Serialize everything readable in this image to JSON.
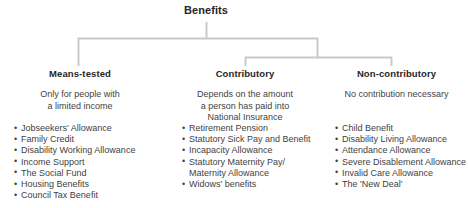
{
  "diagram": {
    "root": {
      "label": "Benefits"
    },
    "branches": [
      {
        "id": "means-tested",
        "heading": "Means-tested",
        "description": [
          "Only for people with",
          "a limited income"
        ],
        "items": [
          "Jobseekers' Allowance",
          "Family Credit",
          "Disability Working Allowance",
          "Income Support",
          "The Social Fund",
          "Housing Benefits",
          "Council Tax Benefit"
        ]
      },
      {
        "id": "contributory",
        "heading": "Contributory",
        "description": [
          "Depends on the amount",
          "a person has paid into",
          "National Insurance"
        ],
        "items": [
          "Retirement Pension",
          "Statutory Sick Pay and Benefit",
          "Incapacity Allowance",
          "Statutory Maternity Pay/",
          "Widows' benefits"
        ],
        "item_continuations": {
          "3": "Maternity Allowance"
        }
      },
      {
        "id": "non-contributory",
        "heading": "Non-contributory",
        "description": [
          "No contribution necessary"
        ],
        "items": [
          "Child Benefit",
          "Disability Living Allowance",
          "Attendance Allowance",
          "Severe Disablement Allowance",
          "Invalid Care Allowance",
          "The 'New Deal'"
        ]
      }
    ],
    "colors": {
      "connector": "#c9c9c9",
      "heading": "#262626",
      "body": "#3f3f3f",
      "background": "#ffffff"
    }
  }
}
